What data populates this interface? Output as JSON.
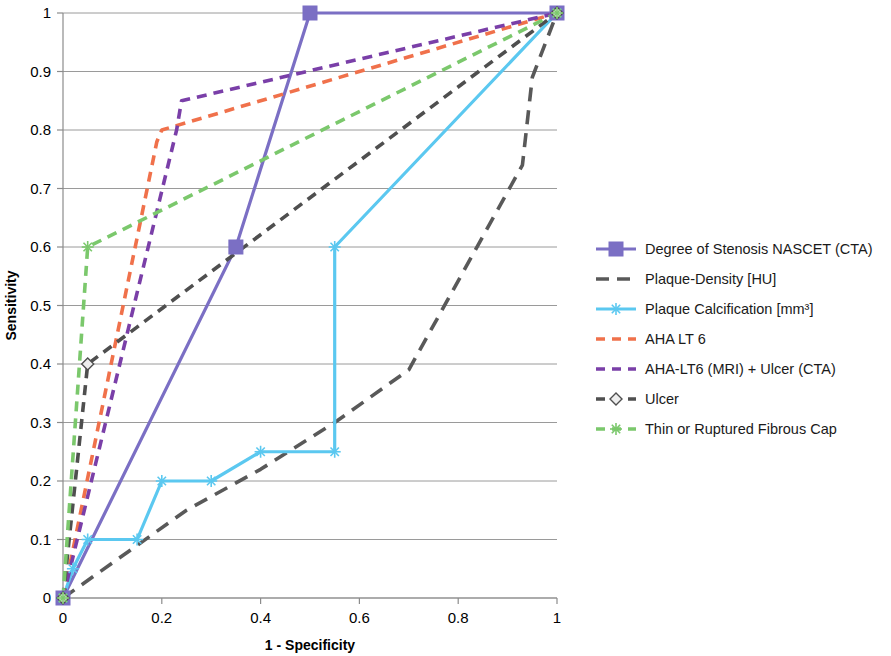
{
  "chart_data": {
    "type": "line",
    "title": "",
    "xlabel": "1 - Specificity",
    "ylabel": "Sensitivity",
    "xlim": [
      0,
      1
    ],
    "ylim": [
      0,
      1
    ],
    "xticks": [
      "0",
      "0.2",
      "0.4",
      "0.6",
      "0.8",
      "1"
    ],
    "xtick_values": [
      0,
      0.2,
      0.4,
      0.6,
      0.8,
      1
    ],
    "yticks": [
      "0",
      "0.1",
      "0.2",
      "0.3",
      "0.4",
      "0.5",
      "0.6",
      "0.7",
      "0.8",
      "0.9",
      "1"
    ],
    "ytick_values": [
      0,
      0.1,
      0.2,
      0.3,
      0.4,
      0.5,
      0.6,
      0.7,
      0.8,
      0.9,
      1
    ],
    "grid": true,
    "legend_position": "right",
    "series": [
      {
        "name": "Degree of Stenosis NASCET (CTA)",
        "color": "#7B6FC4",
        "dash": "solid",
        "marker": "square",
        "x": [
          0,
          0.35,
          0.5,
          1
        ],
        "y": [
          0,
          0.6,
          1,
          1
        ]
      },
      {
        "name": "Plaque-Density [HU]",
        "color": "#595959",
        "dash": "dash-long",
        "marker": "none",
        "x": [
          0,
          0.25,
          0.4,
          0.55,
          0.7,
          0.93,
          0.95,
          1
        ],
        "y": [
          0,
          0.15,
          0.22,
          0.3,
          0.39,
          0.74,
          0.89,
          1
        ]
      },
      {
        "name": "Plaque Calcification [mm³]",
        "color": "#5BC8F0",
        "dash": "solid",
        "marker": "star",
        "x": [
          0,
          0.02,
          0.05,
          0.15,
          0.2,
          0.3,
          0.4,
          0.55,
          0.55,
          1
        ],
        "y": [
          0,
          0.05,
          0.1,
          0.1,
          0.2,
          0.2,
          0.25,
          0.25,
          0.6,
          1
        ]
      },
      {
        "name": "AHA LT 6",
        "color": "#F0714B",
        "dash": "dash",
        "marker": "none",
        "x": [
          0,
          0.19,
          0.2,
          1
        ],
        "y": [
          0,
          0.78,
          0.8,
          1
        ]
      },
      {
        "name": "AHA-LT6 (MRI) + Ulcer (CTA)",
        "color": "#7A3FA8",
        "dash": "dash",
        "marker": "none",
        "x": [
          0,
          0.23,
          0.24,
          1
        ],
        "y": [
          0,
          0.8,
          0.85,
          1
        ]
      },
      {
        "name": "Ulcer",
        "color": "#4F4F4F",
        "dash": "dash",
        "marker": "diamond",
        "x": [
          0,
          0.05,
          1
        ],
        "y": [
          0,
          0.4,
          1
        ]
      },
      {
        "name": "Thin or Ruptured Fibrous Cap",
        "color": "#7BC86C",
        "dash": "dash",
        "marker": "star",
        "x": [
          0,
          0.05,
          1
        ],
        "y": [
          0,
          0.6,
          1
        ]
      }
    ],
    "legend": [
      {
        "label": "Degree of Stenosis NASCET (CTA)",
        "color": "#7B6FC4",
        "marker": "square",
        "dash": "solid"
      },
      {
        "label": "Plaque-Density [HU]",
        "color": "#595959",
        "marker": "none",
        "dash": "dash-long"
      },
      {
        "label": "Plaque Calcification [mm³]",
        "color": "#5BC8F0",
        "marker": "star",
        "dash": "solid"
      },
      {
        "label": "AHA LT 6",
        "color": "#F0714B",
        "marker": "none",
        "dash": "dash"
      },
      {
        "label": "AHA-LT6 (MRI) + Ulcer (CTA)",
        "color": "#7A3FA8",
        "marker": "none",
        "dash": "dash"
      },
      {
        "label": "Ulcer",
        "color": "#4F4F4F",
        "marker": "diamond",
        "dash": "dash"
      },
      {
        "label": "Thin or Ruptured Fibrous Cap",
        "color": "#7BC86C",
        "marker": "star",
        "dash": "dash"
      }
    ]
  },
  "axes": {
    "x_title": "1 - Specificity",
    "y_title": "Sensitivity"
  }
}
